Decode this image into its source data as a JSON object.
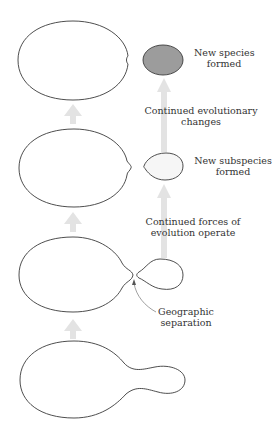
{
  "diagram": {
    "colors": {
      "outline": "#3a3a3a",
      "arrow": "#e3e3e3",
      "new_species_fill": "#9c9c9c",
      "subspecies_fill": "#f6f6f6",
      "pointer": "#888888",
      "text": "#333333"
    },
    "stages": [
      {
        "id": "stage-1",
        "description": "Single population with bulging extension"
      },
      {
        "id": "stage-2",
        "description": "Population with narrow neck connecting small subpopulation"
      },
      {
        "id": "stage-3",
        "description": "Parent population separated from new subspecies"
      },
      {
        "id": "stage-4",
        "description": "Parent population and new species"
      }
    ],
    "labels": {
      "new_species": [
        "New species",
        "formed"
      ],
      "continued_changes": [
        "Continued evolutionary",
        "changes"
      ],
      "new_subspecies": [
        "New subspecies",
        "formed"
      ],
      "continued_forces": [
        "Continued forces of",
        "evolution operate"
      ],
      "geographic_separation": [
        "Geographic",
        "separation"
      ]
    }
  }
}
